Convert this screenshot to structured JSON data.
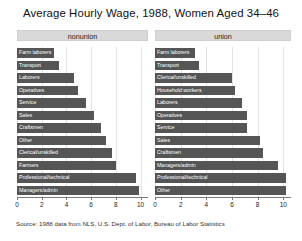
{
  "chart_data": {
    "type": "bar",
    "title": "Average Hourly Wage, 1988, Women Aged 34–46",
    "xlabel": "",
    "ylabel": "",
    "orientation": "horizontal",
    "xlim": [
      0,
      10.6
    ],
    "xticks": [
      0,
      2,
      4,
      6,
      8,
      10
    ],
    "xtick_labels": [
      "0",
      "2",
      "4",
      "6",
      "8",
      "10"
    ],
    "grid": true,
    "legend": "none",
    "bar_color": "#555555",
    "panel_header_color": "#d9d9d9",
    "panels": [
      {
        "name": "nonunion",
        "label": "nonunion",
        "categories": [
          "Farm laborers",
          "Transport",
          "Laborers",
          "Operatives",
          "Service",
          "Sales",
          "Craftsmen",
          "Other",
          "Clerical/unskilled",
          "Farmers",
          "Professional/technical",
          "Managers/admin"
        ],
        "values": [
          3.0,
          3.4,
          4.6,
          4.9,
          5.6,
          6.2,
          6.8,
          7.2,
          7.7,
          8.0,
          9.6,
          9.9
        ]
      },
      {
        "name": "union",
        "label": "union",
        "categories": [
          "Farm laborers",
          "Transport",
          "Clerical/unskilled",
          "Household workers",
          "Laborers",
          "Operatives",
          "Service",
          "Sales",
          "Craftsmen",
          "Managers/admin",
          "Professional/technical",
          "Other"
        ],
        "values": [
          3.1,
          3.4,
          6.0,
          6.2,
          6.8,
          7.2,
          7.2,
          8.2,
          8.4,
          9.6,
          10.2,
          10.2
        ]
      }
    ],
    "source_note": "Source:  1988 data from NLS, U.S. Dept. of Labor, Bureau of Labor Statistics"
  }
}
